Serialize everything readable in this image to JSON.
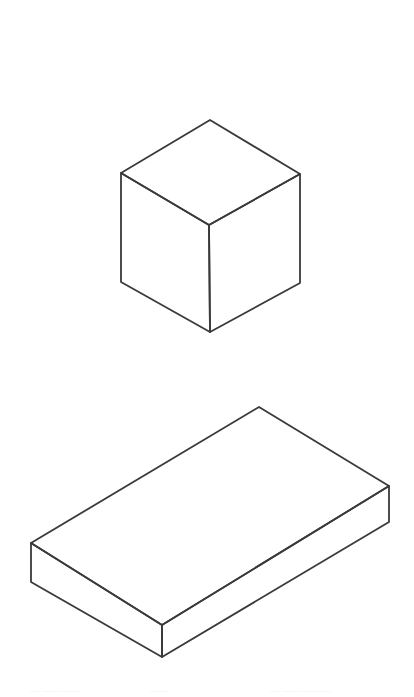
{
  "page": {
    "background_color": "#ffffff",
    "width": 414,
    "height": 697
  },
  "style": {
    "stroke_color": "#3a3a3c",
    "stroke_width": 1.8,
    "face_fill": "#ffffff"
  },
  "figures": [
    {
      "id": "cube",
      "name": "cube",
      "label": "Cube",
      "description": "Isometric line drawing of a cube showing top, left and right faces",
      "vertices": {
        "top": [
          210,
          120
        ],
        "left_top": [
          121,
          173
        ],
        "right_top": [
          300,
          174
        ],
        "center": [
          209,
          225
        ],
        "left_bottom": [
          121,
          282
        ],
        "right_bottom": [
          300,
          283
        ],
        "bottom": [
          210,
          332
        ]
      },
      "faces": {
        "top": "210,120 300,174 209,225 121,173",
        "left": "121,173 209,225 210,332 121,282",
        "right": "209,225 300,174 300,283 210,332"
      }
    },
    {
      "id": "slab",
      "name": "rectangular-slab",
      "label": "Rectangular slab",
      "description": "Isometric line drawing of a flat rectangular box (cuboid slab) showing top, left and right faces",
      "vertices": {
        "top": [
          259,
          407
        ],
        "left_top": [
          31,
          543
        ],
        "right_top": [
          389,
          486
        ],
        "center_top": [
          162,
          625
        ],
        "left_bottom": [
          31,
          582
        ],
        "right_bottom": [
          389,
          522
        ],
        "center_bottom": [
          162,
          657
        ]
      },
      "faces": {
        "top": "259,407 389,486 162,625 31,543",
        "left": "31,543 162,625 162,657 31,582",
        "right": "162,625 389,486 389,522 162,657"
      }
    }
  ],
  "caption_fragments": [
    {
      "text": "— —— ——",
      "left": 30
    },
    {
      "text": "——",
      "left": 150
    },
    {
      "text": "— —— ———",
      "left": 270
    }
  ]
}
